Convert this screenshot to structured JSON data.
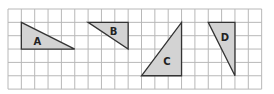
{
  "grid": {
    "x0": 8,
    "y0": 9,
    "cell": 13.35,
    "cols": 19,
    "rows": 6,
    "line_color": "#b8b8b8"
  },
  "triangle_fill": "#d3d3d3",
  "triangle_stroke": "#333333",
  "triangles": [
    {
      "label": "A",
      "points": [
        [
          1,
          1
        ],
        [
          1,
          3
        ],
        [
          5,
          3
        ]
      ],
      "label_pos": [
        2.2,
        2.45
      ]
    },
    {
      "label": "B",
      "points": [
        [
          6,
          1
        ],
        [
          9,
          1
        ],
        [
          9,
          3
        ]
      ],
      "label_pos": [
        7.9,
        1.7
      ]
    },
    {
      "label": "C",
      "points": [
        [
          13,
          1
        ],
        [
          13,
          5
        ],
        [
          10,
          5
        ]
      ],
      "label_pos": [
        11.9,
        3.95
      ]
    },
    {
      "label": "D",
      "points": [
        [
          15,
          1
        ],
        [
          17,
          1
        ],
        [
          17,
          5
        ]
      ],
      "label_pos": [
        16.25,
        2.15
      ]
    }
  ]
}
